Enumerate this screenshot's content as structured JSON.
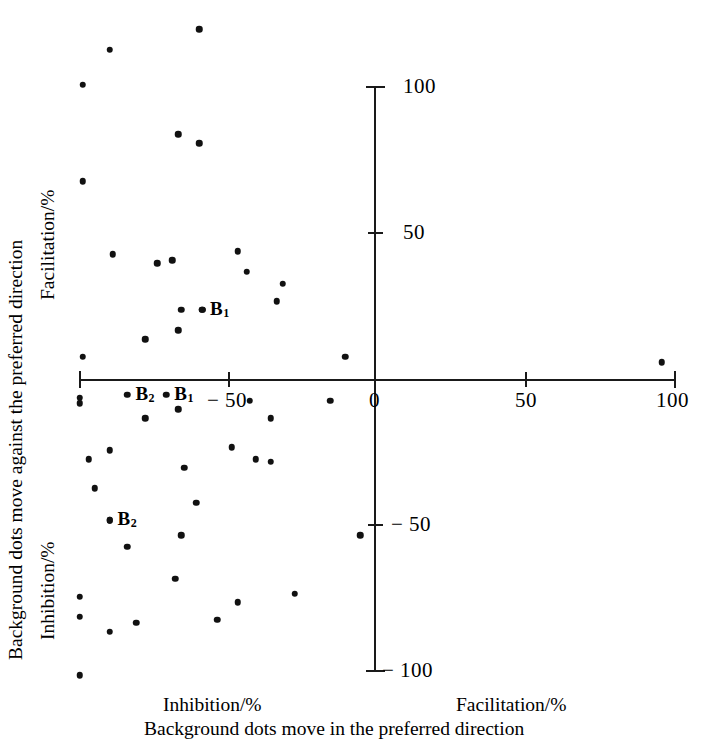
{
  "chart_data": {
    "type": "scatter",
    "title": "",
    "xlabel": "Background dots move in the preferred direction",
    "ylabel": "Background dots move against the preferred direction",
    "xlabel_left_half": "Inhibition/%",
    "xlabel_right_half": "Facilitation/%",
    "ylabel_upper_half": "Facilitation/%",
    "ylabel_lower_half": "Inhibition/%",
    "xlim": [
      -100,
      100
    ],
    "ylim": [
      -100,
      100
    ],
    "xticks": [
      -100,
      -50,
      0,
      50,
      100
    ],
    "xtick_labels": [
      "",
      "− 50",
      "0",
      "50",
      "100"
    ],
    "yticks": [
      -100,
      -50,
      0,
      50,
      100
    ],
    "ytick_labels": [
      "− 100",
      "− 50",
      "",
      "50",
      "100"
    ],
    "grid": false,
    "legend": false,
    "marker": "filled-circle",
    "marker_color": "#111111",
    "axis_color": "#1a1a1a",
    "points": [
      {
        "x": -59,
        "y": 120
      },
      {
        "x": -89,
        "y": 113
      },
      {
        "x": -98,
        "y": 101
      },
      {
        "x": -66,
        "y": 84
      },
      {
        "x": -59,
        "y": 81
      },
      {
        "x": -98,
        "y": 68
      },
      {
        "x": -88,
        "y": 43
      },
      {
        "x": -73,
        "y": 40
      },
      {
        "x": -68,
        "y": 41
      },
      {
        "x": -46,
        "y": 44
      },
      {
        "x": -43,
        "y": 37
      },
      {
        "x": -31,
        "y": 33
      },
      {
        "x": -33,
        "y": 27
      },
      {
        "x": -58,
        "y": 24
      },
      {
        "x": -65,
        "y": 24
      },
      {
        "x": -66,
        "y": 17
      },
      {
        "x": -77,
        "y": 14
      },
      {
        "x": -98,
        "y": 8
      },
      {
        "x": -10,
        "y": 8
      },
      {
        "x": 96,
        "y": 6
      },
      {
        "x": -99,
        "y": -6
      },
      {
        "x": -99,
        "y": -8
      },
      {
        "x": -66,
        "y": -10
      },
      {
        "x": -77,
        "y": -13
      },
      {
        "x": -42,
        "y": -7
      },
      {
        "x": -15,
        "y": -7
      },
      {
        "x": -35,
        "y": -13
      },
      {
        "x": -89,
        "y": -24
      },
      {
        "x": -96,
        "y": -27
      },
      {
        "x": -48,
        "y": -23
      },
      {
        "x": -40,
        "y": -27
      },
      {
        "x": -35,
        "y": -28
      },
      {
        "x": -64,
        "y": -30
      },
      {
        "x": -94,
        "y": -37
      },
      {
        "x": -60,
        "y": -42
      },
      {
        "x": -89,
        "y": -48
      },
      {
        "x": -5,
        "y": -53
      },
      {
        "x": -65,
        "y": -53
      },
      {
        "x": -83,
        "y": -57
      },
      {
        "x": -67,
        "y": -68
      },
      {
        "x": -99,
        "y": -74
      },
      {
        "x": -99,
        "y": -81
      },
      {
        "x": -89,
        "y": -86
      },
      {
        "x": -80,
        "y": -83
      },
      {
        "x": -53,
        "y": -82
      },
      {
        "x": -46,
        "y": -76
      },
      {
        "x": -27,
        "y": -73
      },
      {
        "x": -99,
        "y": -101
      }
    ],
    "labeled_points": [
      {
        "label": "B",
        "sub": "1",
        "x": -58,
        "y": 24,
        "label_dx": 8,
        "label_dy": 0
      },
      {
        "label": "B",
        "sub": "1",
        "x": -70,
        "y": -5,
        "label_dx": 8,
        "label_dy": 0
      },
      {
        "label": "B",
        "sub": "2",
        "x": -83,
        "y": -5,
        "label_dx": 8,
        "label_dy": 0
      },
      {
        "label": "B",
        "sub": "2",
        "x": -89,
        "y": -48,
        "label_dx": 8,
        "label_dy": 0
      }
    ]
  },
  "axis_titles": {
    "y_outer": "Background dots move against the preferred direction",
    "y_upper": "Facilitation/%",
    "y_lower": "Inhibition/%",
    "x_left": "Inhibition/%",
    "x_right": "Facilitation/%",
    "x_outer": "Background dots move in the preferred direction"
  },
  "tick_text": {
    "y_100": "100",
    "y_50": "50",
    "y_neg50": "− 50",
    "y_neg100": "− 100",
    "x_neg50": "− 50",
    "x_0": "0",
    "x_50": "50",
    "x_100": "100"
  }
}
